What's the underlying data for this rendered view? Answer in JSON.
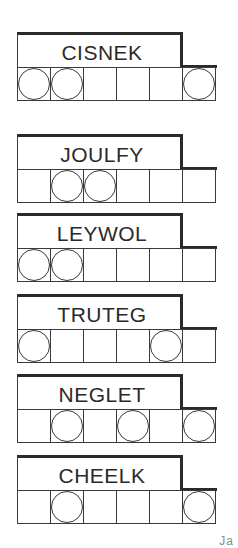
{
  "puzzles": [
    {
      "word": "CISNEK",
      "top": 32,
      "circles": [
        true,
        true,
        false,
        false,
        false,
        true
      ]
    },
    {
      "word": "JOULFY",
      "top": 134,
      "circles": [
        false,
        true,
        true,
        false,
        false,
        false
      ]
    },
    {
      "word": "LEYWOL",
      "top": 213,
      "circles": [
        true,
        true,
        false,
        false,
        false,
        false
      ]
    },
    {
      "word": "TRUTEG",
      "top": 294,
      "circles": [
        true,
        false,
        false,
        false,
        true,
        false
      ]
    },
    {
      "word": "NEGLET",
      "top": 374,
      "circles": [
        false,
        true,
        false,
        true,
        false,
        true
      ]
    },
    {
      "word": "CHEELK",
      "top": 455,
      "circles": [
        false,
        true,
        false,
        false,
        false,
        true
      ]
    }
  ],
  "page_mark": "Ja"
}
